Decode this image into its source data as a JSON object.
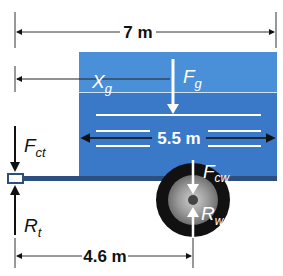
{
  "diagram": {
    "type": "free-body diagram of trailer",
    "dimensions": {
      "overall_length": "7 m",
      "tank_length": "5.5 m",
      "hitch_to_wheel": "4.6 m"
    },
    "labels": {
      "overall": "7 m",
      "tank": "5.5 m",
      "wheelbase": "4.6 m",
      "xg_main": "X",
      "xg_sub": "g",
      "fg_main": "F",
      "fg_sub": "g",
      "fct_main": "F",
      "fct_sub": "ct",
      "rt_main": "R",
      "rt_sub": "t",
      "fcw_main": "F",
      "fcw_sub": "cw",
      "rw_main": "R",
      "rw_sub": "w"
    },
    "forces": [
      {
        "name": "Fg",
        "direction": "down",
        "location": "center of gravity"
      },
      {
        "name": "Fct",
        "direction": "down",
        "location": "hitch"
      },
      {
        "name": "Rt",
        "direction": "up",
        "location": "hitch"
      },
      {
        "name": "Fcw",
        "direction": "down",
        "location": "wheel axle"
      },
      {
        "name": "Rw",
        "direction": "up",
        "location": "wheel axle"
      }
    ],
    "colors": {
      "tank_top": "#4a90d9",
      "tank_body": "#3a78c8",
      "frame": "#2c4f80",
      "tire": "#111111",
      "rim": "#9a9a9a",
      "arrow": "#111111",
      "arrow_white": "#ffffff"
    }
  }
}
